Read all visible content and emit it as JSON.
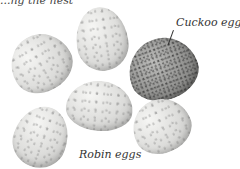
{
  "caption_fragment": "...ng the nest",
  "labels": {
    "cuckoo": "Cuckoo egg",
    "robin": "Robin eggs"
  },
  "eggs": [
    {
      "type": "robin",
      "position": "left-top"
    },
    {
      "type": "robin",
      "position": "top-center"
    },
    {
      "type": "cuckoo",
      "position": "right"
    },
    {
      "type": "robin",
      "position": "bottom-left"
    },
    {
      "type": "robin",
      "position": "center"
    },
    {
      "type": "robin",
      "position": "bottom-right"
    }
  ],
  "colors": {
    "background": "#ffffff",
    "robin_egg": "#dcdcda",
    "cuckoo_egg": "#8e8e8c",
    "label_text": "#333333"
  }
}
